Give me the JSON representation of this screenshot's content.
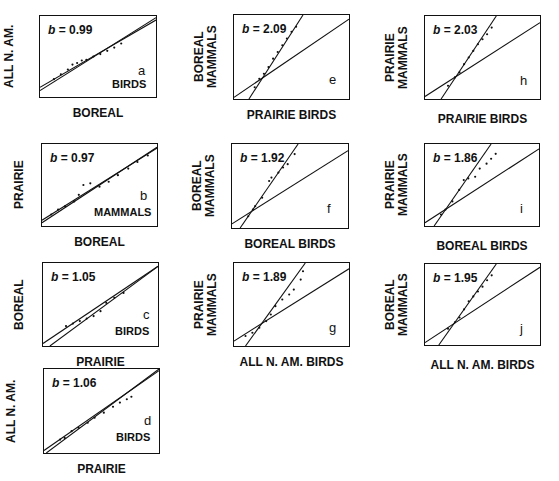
{
  "chart_data": [
    {
      "type": "scatter",
      "panel": "a",
      "xlabel": "BOREAL",
      "ylabel": "ALL N. AM.",
      "taxon": "BIRDS",
      "slope_label": "b",
      "slope": "0.99",
      "reference_line": "1:1",
      "box": {
        "x": 39,
        "y": 15,
        "w": 118,
        "h": 83
      },
      "fit": {
        "x1": 0,
        "y1": 0.88,
        "x2": 1,
        "y2": 0.05
      },
      "ref": {
        "x1": 0,
        "y1": 0.92,
        "x2": 1,
        "y2": 0.02
      },
      "points": [
        [
          0.12,
          0.78
        ],
        [
          0.18,
          0.72
        ],
        [
          0.24,
          0.66
        ],
        [
          0.28,
          0.6
        ],
        [
          0.32,
          0.58
        ],
        [
          0.36,
          0.55
        ],
        [
          0.4,
          0.54
        ],
        [
          0.46,
          0.5
        ],
        [
          0.52,
          0.47
        ],
        [
          0.58,
          0.43
        ],
        [
          0.64,
          0.39
        ],
        [
          0.7,
          0.34
        ]
      ]
    },
    {
      "type": "scatter",
      "panel": "b",
      "xlabel": "BOREAL",
      "ylabel": "PRAIRIE",
      "taxon": "MAMMALS",
      "slope_label": "b",
      "slope": "0.97",
      "reference_line": "1:1",
      "box": {
        "x": 41,
        "y": 143,
        "w": 117,
        "h": 84
      },
      "fit": {
        "x1": 0,
        "y1": 0.93,
        "x2": 1,
        "y2": 0.05
      },
      "ref": {
        "x1": 0,
        "y1": 0.96,
        "x2": 1,
        "y2": 0.04
      },
      "points": [
        [
          0.08,
          0.86
        ],
        [
          0.14,
          0.8
        ],
        [
          0.2,
          0.76
        ],
        [
          0.28,
          0.7
        ],
        [
          0.32,
          0.62
        ],
        [
          0.36,
          0.5
        ],
        [
          0.42,
          0.48
        ],
        [
          0.5,
          0.52
        ],
        [
          0.58,
          0.46
        ],
        [
          0.66,
          0.38
        ],
        [
          0.75,
          0.3
        ],
        [
          0.83,
          0.22
        ],
        [
          0.92,
          0.14
        ]
      ]
    },
    {
      "type": "scatter",
      "panel": "c",
      "xlabel": "PRAIRIE",
      "ylabel": "BOREAL",
      "taxon": "BIRDS",
      "slope_label": "b",
      "slope": "1.05",
      "reference_line": "1:1",
      "box": {
        "x": 42,
        "y": 262,
        "w": 117,
        "h": 85
      },
      "fit": {
        "x1": 0,
        "y1": 0.97,
        "x2": 1,
        "y2": 0.04
      },
      "ref": {
        "x1": 0.06,
        "y1": 1.0,
        "x2": 1,
        "y2": 0.04
      },
      "points": [
        [
          0.2,
          0.76
        ],
        [
          0.26,
          0.73
        ],
        [
          0.32,
          0.7
        ],
        [
          0.38,
          0.67
        ],
        [
          0.44,
          0.64
        ],
        [
          0.5,
          0.58
        ],
        [
          0.55,
          0.48
        ],
        [
          0.62,
          0.42
        ],
        [
          0.7,
          0.36
        ]
      ]
    },
    {
      "type": "scatter",
      "panel": "d",
      "xlabel": "PRAIRIE",
      "ylabel": "ALL N. AM.",
      "taxon": "BIRDS",
      "slope_label": "b",
      "slope": "1.06",
      "reference_line": "1:1",
      "box": {
        "x": 43,
        "y": 368,
        "w": 117,
        "h": 86
      },
      "fit": {
        "x1": 0,
        "y1": 0.97,
        "x2": 1,
        "y2": 0.02
      },
      "ref": {
        "x1": 0.02,
        "y1": 1.0,
        "x2": 1,
        "y2": 0.0
      },
      "points": [
        [
          0.14,
          0.84
        ],
        [
          0.18,
          0.82
        ],
        [
          0.24,
          0.74
        ],
        [
          0.3,
          0.7
        ],
        [
          0.38,
          0.64
        ],
        [
          0.44,
          0.58
        ],
        [
          0.52,
          0.52
        ],
        [
          0.6,
          0.45
        ],
        [
          0.66,
          0.4
        ],
        [
          0.72,
          0.36
        ],
        [
          0.76,
          0.33
        ]
      ]
    },
    {
      "type": "scatter",
      "panel": "e",
      "xlabel": "PRAIRIE BIRDS",
      "ylabel": "BOREAL MAMMALS",
      "taxon": "",
      "slope_label": "b",
      "slope": "2.09",
      "reference_line": "1:1",
      "box": {
        "x": 233,
        "y": 14,
        "w": 117,
        "h": 86
      },
      "fit": {
        "x1": 0.13,
        "y1": 1.0,
        "x2": 0.6,
        "y2": 0.0
      },
      "ref": {
        "x1": 0,
        "y1": 0.98,
        "x2": 1,
        "y2": 0.05
      },
      "points": [
        [
          0.18,
          0.86
        ],
        [
          0.22,
          0.76
        ],
        [
          0.26,
          0.7
        ],
        [
          0.3,
          0.62
        ],
        [
          0.34,
          0.52
        ],
        [
          0.38,
          0.44
        ],
        [
          0.42,
          0.36
        ],
        [
          0.46,
          0.28
        ],
        [
          0.5,
          0.2
        ],
        [
          0.54,
          0.14
        ]
      ]
    },
    {
      "type": "scatter",
      "panel": "f",
      "xlabel": "BOREAL BIRDS",
      "ylabel": "BOREAL MAMMALS",
      "taxon": "",
      "slope_label": "b",
      "slope": "1.92",
      "reference_line": "1:1",
      "box": {
        "x": 231,
        "y": 143,
        "w": 118,
        "h": 86
      },
      "fit": {
        "x1": 0.07,
        "y1": 1.0,
        "x2": 0.57,
        "y2": 0.0
      },
      "ref": {
        "x1": 0,
        "y1": 0.95,
        "x2": 1,
        "y2": 0.08
      },
      "points": [
        [
          0.14,
          0.86
        ],
        [
          0.18,
          0.78
        ],
        [
          0.2,
          0.74
        ],
        [
          0.26,
          0.64
        ],
        [
          0.32,
          0.44
        ],
        [
          0.34,
          0.4
        ],
        [
          0.4,
          0.34
        ],
        [
          0.44,
          0.28
        ],
        [
          0.48,
          0.24
        ],
        [
          0.54,
          0.12
        ]
      ]
    },
    {
      "type": "scatter",
      "panel": "g",
      "xlabel": "ALL N. AM. BIRDS",
      "ylabel": "PRAIRIE MAMMALS",
      "taxon": "",
      "slope_label": "b",
      "slope": "1.89",
      "reference_line": "1:1",
      "box": {
        "x": 233,
        "y": 262,
        "w": 117,
        "h": 85
      },
      "fit": {
        "x1": 0.1,
        "y1": 1.0,
        "x2": 0.62,
        "y2": 0.0
      },
      "ref": {
        "x1": 0,
        "y1": 0.94,
        "x2": 1,
        "y2": 0.07
      },
      "points": [
        [
          0.1,
          0.88
        ],
        [
          0.16,
          0.84
        ],
        [
          0.22,
          0.78
        ],
        [
          0.28,
          0.7
        ],
        [
          0.32,
          0.62
        ],
        [
          0.36,
          0.52
        ],
        [
          0.42,
          0.44
        ],
        [
          0.48,
          0.38
        ],
        [
          0.52,
          0.32
        ],
        [
          0.58,
          0.2
        ],
        [
          0.6,
          0.1
        ]
      ]
    },
    {
      "type": "scatter",
      "panel": "h",
      "xlabel": "PRAIRIE BIRDS",
      "ylabel": "PRAIRIE MAMMALS",
      "taxon": "",
      "slope_label": "b",
      "slope": "2.03",
      "reference_line": "1:1",
      "box": {
        "x": 424,
        "y": 15,
        "w": 117,
        "h": 85
      },
      "fit": {
        "x1": 0.14,
        "y1": 1.0,
        "x2": 0.62,
        "y2": 0.0
      },
      "ref": {
        "x1": 0,
        "y1": 0.97,
        "x2": 1,
        "y2": 0.08
      },
      "points": [
        [
          0.2,
          0.84
        ],
        [
          0.26,
          0.74
        ],
        [
          0.3,
          0.68
        ],
        [
          0.34,
          0.58
        ],
        [
          0.38,
          0.5
        ],
        [
          0.42,
          0.42
        ],
        [
          0.46,
          0.34
        ],
        [
          0.5,
          0.28
        ],
        [
          0.54,
          0.22
        ],
        [
          0.58,
          0.14
        ]
      ]
    },
    {
      "type": "scatter",
      "panel": "i",
      "xlabel": "BOREAL BIRDS",
      "ylabel": "PRAIRIE MAMMALS",
      "taxon": "",
      "slope_label": "b",
      "slope": "1.86",
      "reference_line": "1:1",
      "box": {
        "x": 424,
        "y": 143,
        "w": 116,
        "h": 84
      },
      "fit": {
        "x1": 0.08,
        "y1": 1.0,
        "x2": 0.58,
        "y2": 0.0
      },
      "ref": {
        "x1": 0,
        "y1": 0.96,
        "x2": 1,
        "y2": 0.06
      },
      "points": [
        [
          0.14,
          0.86
        ],
        [
          0.18,
          0.8
        ],
        [
          0.24,
          0.7
        ],
        [
          0.3,
          0.56
        ],
        [
          0.34,
          0.44
        ],
        [
          0.38,
          0.42
        ],
        [
          0.44,
          0.4
        ],
        [
          0.48,
          0.3
        ],
        [
          0.54,
          0.24
        ],
        [
          0.58,
          0.18
        ],
        [
          0.62,
          0.12
        ]
      ]
    },
    {
      "type": "scatter",
      "panel": "j",
      "xlabel": "ALL N. AM. BIRDS",
      "ylabel": "BOREAL MAMMALS",
      "taxon": "",
      "slope_label": "b",
      "slope": "1.95",
      "reference_line": "1:1",
      "box": {
        "x": 424,
        "y": 263,
        "w": 117,
        "h": 83
      },
      "fit": {
        "x1": 0.12,
        "y1": 1.0,
        "x2": 0.62,
        "y2": 0.0
      },
      "ref": {
        "x1": 0,
        "y1": 0.97,
        "x2": 1,
        "y2": 0.04
      },
      "points": [
        [
          0.2,
          0.8
        ],
        [
          0.26,
          0.72
        ],
        [
          0.3,
          0.66
        ],
        [
          0.34,
          0.56
        ],
        [
          0.38,
          0.46
        ],
        [
          0.42,
          0.4
        ],
        [
          0.46,
          0.34
        ],
        [
          0.5,
          0.28
        ],
        [
          0.54,
          0.2
        ],
        [
          0.58,
          0.14
        ]
      ]
    }
  ],
  "panels": [
    {
      "id": "a",
      "letter": "a",
      "slope_prefix": "b",
      "slope_text": " = 0.99",
      "taxon": "BIRDS",
      "xlabel": "BOREAL",
      "ylabel": "ALL N. AM."
    },
    {
      "id": "b",
      "letter": "b",
      "slope_prefix": "b",
      "slope_text": " = 0.97",
      "taxon": "MAMMALS",
      "xlabel": "BOREAL",
      "ylabel": "PRAIRIE"
    },
    {
      "id": "c",
      "letter": "c",
      "slope_prefix": "b",
      "slope_text": " = 1.05",
      "taxon": "BIRDS",
      "xlabel": "PRAIRIE",
      "ylabel": "BOREAL"
    },
    {
      "id": "d",
      "letter": "d",
      "slope_prefix": "b",
      "slope_text": " = 1.06",
      "taxon": "BIRDS",
      "xlabel": "PRAIRIE",
      "ylabel": "ALL N. AM."
    },
    {
      "id": "e",
      "letter": "e",
      "slope_prefix": "b",
      "slope_text": " = 2.09",
      "taxon": "",
      "xlabel": "PRAIRIE BIRDS",
      "ylabel": "BOREAL MAMMALS"
    },
    {
      "id": "f",
      "letter": "f",
      "slope_prefix": "b",
      "slope_text": " = 1.92",
      "taxon": "",
      "xlabel": "BOREAL BIRDS",
      "ylabel": "BOREAL MAMMALS"
    },
    {
      "id": "g",
      "letter": "g",
      "slope_prefix": "b",
      "slope_text": " = 1.89",
      "taxon": "",
      "xlabel": "ALL N. AM. BIRDS",
      "ylabel": "PRAIRIE MAMMALS"
    },
    {
      "id": "h",
      "letter": "h",
      "slope_prefix": "b",
      "slope_text": " = 2.03",
      "taxon": "",
      "xlabel": "PRAIRIE BIRDS",
      "ylabel": "PRAIRIE MAMMALS"
    },
    {
      "id": "i",
      "letter": "i",
      "slope_prefix": "b",
      "slope_text": " = 1.86",
      "taxon": "",
      "xlabel": "BOREAL BIRDS",
      "ylabel": "PRAIRIE MAMMALS"
    },
    {
      "id": "j",
      "letter": "j",
      "slope_prefix": "b",
      "slope_text": " = 1.95",
      "taxon": "",
      "xlabel": "ALL N. AM. BIRDS",
      "ylabel": "BOREAL MAMMALS"
    }
  ],
  "colors": {
    "ink": "#111111",
    "background": "#ffffff"
  }
}
